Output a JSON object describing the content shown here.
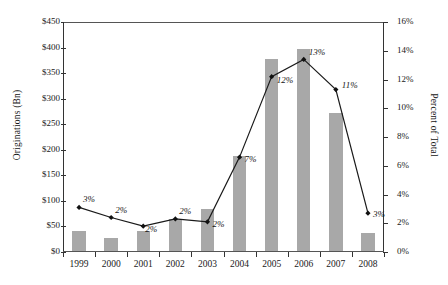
{
  "chart_data": {
    "type": "bar",
    "title": "",
    "subtitle": "",
    "xlabel": "",
    "ylabel": "Originations (Bn)",
    "y2label": "Percent of Total",
    "categories": [
      "1999",
      "2000",
      "2001",
      "2002",
      "2003",
      "2004",
      "2005",
      "2006",
      "2007",
      "2008"
    ],
    "ylim": [
      0,
      450
    ],
    "y2lim": [
      0,
      16
    ],
    "ytick_labels": [
      "$0",
      "$50",
      "$100",
      "$150",
      "$200",
      "$250",
      "$300",
      "$350",
      "$400",
      "$450"
    ],
    "ytick_values": [
      0,
      50,
      100,
      150,
      200,
      250,
      300,
      350,
      400,
      450
    ],
    "y2tick_labels": [
      "0%",
      "2%",
      "4%",
      "6%",
      "8%",
      "10%",
      "12%",
      "14%",
      "16%"
    ],
    "y2tick_values": [
      0,
      2,
      4,
      6,
      8,
      10,
      12,
      14,
      16
    ],
    "grid": false,
    "legend": "none",
    "series": [
      {
        "name": "Originations (Bn)",
        "type": "bar",
        "axis": "left",
        "color": "#a8a8a8",
        "values": [
          40,
          25,
          40,
          62,
          82,
          185,
          375,
          396,
          270,
          36
        ]
      },
      {
        "name": "Percent of Total",
        "type": "line",
        "axis": "right",
        "color": "#1a1a1a",
        "marker": "diamond",
        "values": [
          3.1,
          2.4,
          1.8,
          2.3,
          2.1,
          6.6,
          12.2,
          13.4,
          11.3,
          2.7
        ],
        "point_labels": [
          "3%",
          "2%",
          "2%",
          "2%",
          "2%",
          "7%",
          "12%",
          "13%",
          "11%",
          "3%"
        ]
      }
    ]
  }
}
